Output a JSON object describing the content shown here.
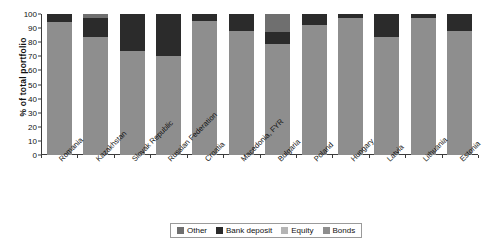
{
  "chart_data": {
    "type": "bar",
    "stacked": true,
    "title": "",
    "xlabel": "",
    "ylabel": "% of total portfolio",
    "ylim": [
      0,
      100
    ],
    "ytick_step": 10,
    "yticks": [
      0,
      10,
      20,
      30,
      40,
      50,
      60,
      70,
      80,
      90,
      100
    ],
    "grid": false,
    "legend_position": "bottom",
    "categories": [
      "Romania",
      "Kazakhstan",
      "Slovak Republic",
      "Russian Federation",
      "Croatia",
      "Macedonia, FYR",
      "Bulgaria",
      "Poland",
      "Hungary",
      "Latvia",
      "Lithuania",
      "Estonia"
    ],
    "series": [
      {
        "name": "Bonds",
        "color": "#8e8e8e",
        "values": [
          94,
          84,
          74,
          70,
          95,
          88,
          79,
          92,
          97,
          84,
          97,
          88
        ]
      },
      {
        "name": "Equity",
        "color": "#b5b5b5",
        "values": [
          0,
          0,
          0,
          0,
          0,
          0,
          0,
          0,
          0,
          0,
          0,
          0
        ]
      },
      {
        "name": "Bank deposit",
        "color": "#2b2b2b",
        "values": [
          6,
          13,
          26,
          30,
          5,
          12,
          8,
          8,
          3,
          16,
          3,
          12
        ]
      },
      {
        "name": "Other",
        "color": "#6f6f6f",
        "values": [
          0,
          3,
          0,
          0,
          0,
          0,
          13,
          0,
          0,
          0,
          0,
          0
        ]
      }
    ],
    "legend_entries": [
      {
        "label": "Other",
        "color": "#6f6f6f"
      },
      {
        "label": "Bank deposit",
        "color": "#2b2b2b"
      },
      {
        "label": "Equity",
        "color": "#b5b5b5"
      },
      {
        "label": "Bonds",
        "color": "#8e8e8e"
      }
    ],
    "colors": {
      "other": "#6f6f6f",
      "bank_deposit": "#2b2b2b",
      "equity": "#b5b5b5",
      "bonds": "#8e8e8e",
      "axis": "#3b3b3b",
      "text": "#111111",
      "background": "#ffffff"
    }
  }
}
